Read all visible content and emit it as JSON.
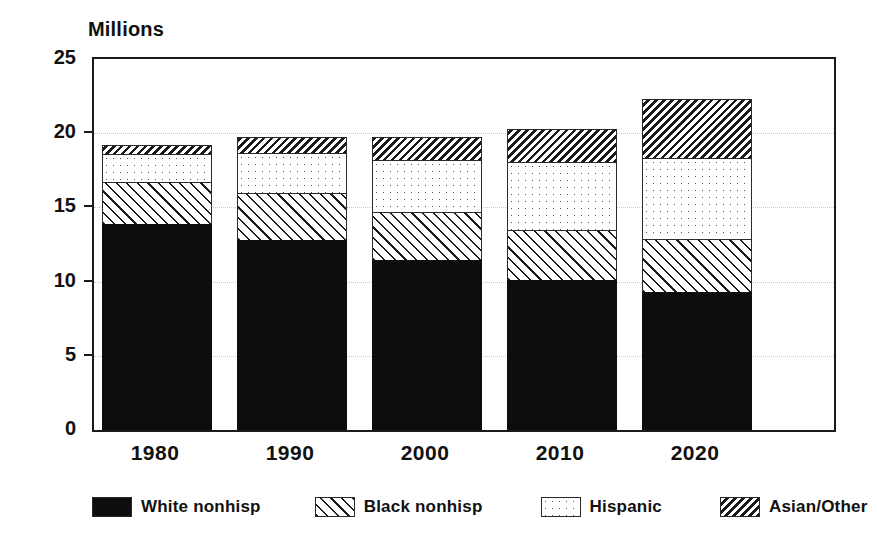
{
  "chart_data": {
    "type": "bar",
    "subtype": "stacked-bar",
    "title": "",
    "unit_caption": "Millions",
    "xlabel": "",
    "ylabel": "Millions",
    "ylim": [
      0,
      25
    ],
    "yticks": [
      0,
      5,
      10,
      15,
      20,
      25
    ],
    "ytick_labels": [
      "0",
      "5",
      "10",
      "15",
      "20",
      "25"
    ],
    "grid": true,
    "grid_axis": "y",
    "legend_position": "bottom",
    "categories": [
      "1980",
      "1990",
      "2000",
      "2010",
      "2020"
    ],
    "series": [
      {
        "name": "White nonhisp",
        "pattern": "solid-black",
        "color": "#0d0d0d",
        "values": [
          13.9,
          12.8,
          11.45,
          10.1,
          9.3
        ]
      },
      {
        "name": "Black nonhisp",
        "pattern": "diagonal-hatch",
        "color": "#ffffff",
        "values": [
          2.8,
          3.2,
          3.25,
          3.4,
          3.6
        ]
      },
      {
        "name": "Hispanic",
        "pattern": "dotted",
        "color": "#ffffff",
        "values": [
          1.9,
          2.7,
          3.5,
          4.55,
          5.4
        ]
      },
      {
        "name": "Asian/Other",
        "pattern": "dense-diagonal-hatch",
        "color": "#ffffff",
        "values": [
          0.6,
          1.05,
          1.55,
          2.25,
          4.0
        ]
      }
    ],
    "totals": [
      19.2,
      19.75,
      19.75,
      20.3,
      22.3
    ]
  },
  "legend": {
    "items": [
      {
        "label": "White nonhisp",
        "swatch": "solid-black-swatch"
      },
      {
        "label": "Black nonhisp",
        "swatch": "diagonal-hatch-swatch"
      },
      {
        "label": "Hispanic",
        "swatch": "dotted-swatch"
      },
      {
        "label": "Asian/Other",
        "swatch": "dense-hatch-swatch"
      }
    ]
  }
}
